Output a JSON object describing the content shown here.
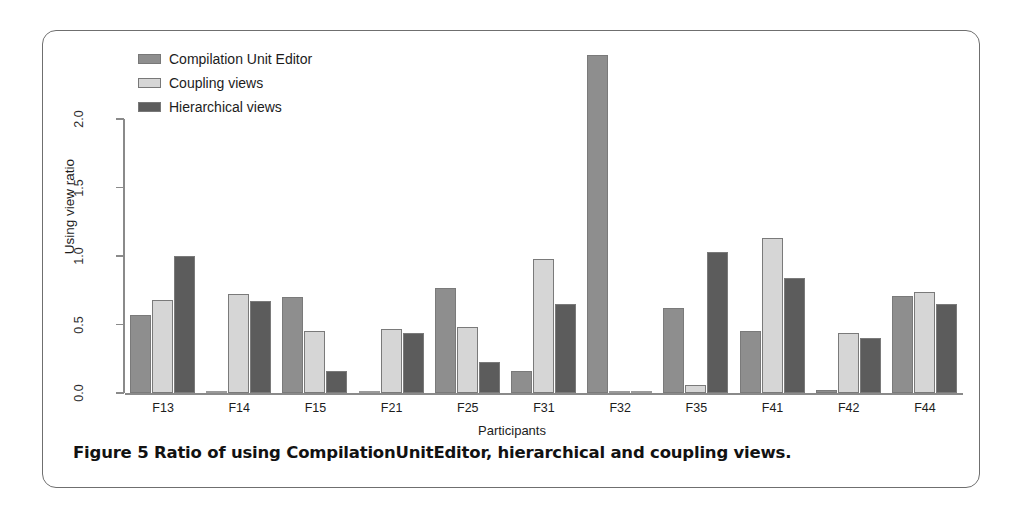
{
  "figure": {
    "caption": "Figure 5 Ratio of using CompilationUnitEditor, hierarchical and coupling views."
  },
  "legend": {
    "position": "top-left",
    "entries": [
      {
        "label": "Compilation Unit Editor",
        "color": "#8e8e8e"
      },
      {
        "label": "Coupling views",
        "color": "#d6d6d6"
      },
      {
        "label": "Hierarchical views",
        "color": "#5c5c5c"
      }
    ]
  },
  "chart_data": {
    "type": "bar",
    "title": "",
    "subtitle": "",
    "xlabel": "Participants",
    "ylabel": "Using view ratio",
    "ylim": [
      0.0,
      2.5
    ],
    "yticks": [
      "0.0",
      "0.5",
      "1.0",
      "1.5",
      "2.0"
    ],
    "ytick_values": [
      0.0,
      0.5,
      1.0,
      1.5,
      2.0
    ],
    "grid": false,
    "legend_position": "top-left",
    "categories": [
      "F13",
      "F14",
      "F15",
      "F21",
      "F25",
      "F31",
      "F32",
      "F35",
      "F41",
      "F42",
      "F44"
    ],
    "series": [
      {
        "name": "Compilation Unit Editor",
        "color": "#8e8e8e",
        "values": [
          0.57,
          0.01,
          0.7,
          0.01,
          0.77,
          0.16,
          2.47,
          0.62,
          0.45,
          0.02,
          0.71
        ]
      },
      {
        "name": "Coupling views",
        "color": "#d6d6d6",
        "values": [
          0.68,
          0.72,
          0.45,
          0.47,
          0.48,
          0.98,
          0.0,
          0.06,
          1.13,
          0.44,
          0.74
        ]
      },
      {
        "name": "Hierarchical views",
        "color": "#5c5c5c",
        "values": [
          1.0,
          0.67,
          0.16,
          0.44,
          0.23,
          0.65,
          0.0,
          1.03,
          0.84,
          0.4,
          0.65
        ]
      }
    ]
  }
}
